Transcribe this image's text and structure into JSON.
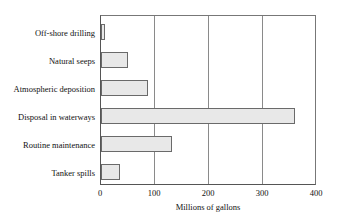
{
  "chart_data": {
    "type": "bar",
    "orientation": "horizontal",
    "title": "",
    "xlabel": "Millions of gallons",
    "ylabel": "",
    "categories": [
      "Off-shore drilling",
      "Natural seeps",
      "Atmospheric deposition",
      "Disposal in waterways",
      "Routine maintenance",
      "Tanker spills"
    ],
    "values": [
      4,
      50,
      88,
      360,
      133,
      35
    ],
    "xlim": [
      0,
      400
    ],
    "xticks": [
      0,
      100,
      200,
      300,
      400
    ],
    "xtick_labels": [
      "0",
      "100",
      "200",
      "300",
      "400"
    ],
    "grid": "vertical",
    "legend": null,
    "colors": {
      "bar_fill": "#e8e8e8",
      "bar_border": "#6a6a6a",
      "gridline": "#8a8a8a",
      "axis": "#555555",
      "text": "#111111",
      "background": "#ffffff"
    }
  }
}
